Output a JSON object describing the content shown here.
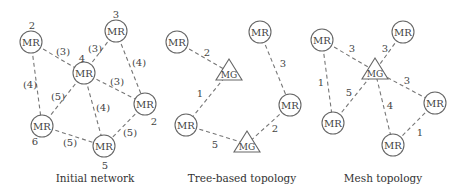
{
  "panels": [
    {
      "id": "initial",
      "caption": "Initial network",
      "caption_pos": [
        95,
        178
      ],
      "nodes": [
        {
          "id": "a",
          "type": "MR",
          "label": "MR",
          "x": 31,
          "y": 42,
          "tag": "2",
          "tag_pos": [
            32,
            25
          ]
        },
        {
          "id": "b",
          "type": "MR",
          "label": "MR",
          "x": 116,
          "y": 31,
          "tag": "3",
          "tag_pos": [
            116,
            14
          ]
        },
        {
          "id": "c",
          "type": "MR",
          "label": "MR",
          "x": 84,
          "y": 73,
          "tag": "4",
          "tag_pos": [
            82,
            58
          ]
        },
        {
          "id": "d",
          "type": "MR",
          "label": "MR",
          "x": 145,
          "y": 104,
          "tag": "2",
          "tag_pos": [
            154,
            121
          ]
        },
        {
          "id": "e",
          "type": "MR",
          "label": "MR",
          "x": 42,
          "y": 126,
          "tag": "6",
          "tag_pos": [
            35,
            141
          ]
        },
        {
          "id": "f",
          "type": "MR",
          "label": "MR",
          "x": 104,
          "y": 146,
          "tag": "5",
          "tag_pos": [
            105,
            165
          ]
        }
      ],
      "edges": [
        {
          "from": "a",
          "to": "c",
          "label": "(3)",
          "pos": [
            63,
            51
          ]
        },
        {
          "from": "b",
          "to": "c",
          "label": "(3)",
          "pos": [
            95,
            48
          ]
        },
        {
          "from": "b",
          "to": "d",
          "label": "(4)",
          "pos": [
            139,
            62
          ]
        },
        {
          "from": "c",
          "to": "d",
          "label": "(3)",
          "pos": [
            117,
            81
          ]
        },
        {
          "from": "a",
          "to": "e",
          "label": "(4)",
          "pos": [
            30,
            84
          ]
        },
        {
          "from": "c",
          "to": "e",
          "label": "(5)",
          "pos": [
            58,
            96
          ]
        },
        {
          "from": "c",
          "to": "f",
          "label": "(4)",
          "pos": [
            103,
            107
          ]
        },
        {
          "from": "e",
          "to": "f",
          "label": "(5)",
          "pos": [
            70,
            142
          ]
        },
        {
          "from": "d",
          "to": "f",
          "label": "(5)",
          "pos": [
            130,
            132
          ]
        }
      ]
    },
    {
      "id": "tree",
      "caption": "Tree-based topology",
      "caption_pos": [
        242,
        178
      ],
      "nodes": [
        {
          "id": "a",
          "type": "MR",
          "label": "MR",
          "x": 177,
          "y": 42
        },
        {
          "id": "g1",
          "type": "MG",
          "label": "MG",
          "x": 229,
          "y": 72
        },
        {
          "id": "b",
          "type": "MR",
          "label": "MR",
          "x": 260,
          "y": 32
        },
        {
          "id": "c",
          "type": "MR",
          "label": "MR",
          "x": 290,
          "y": 105
        },
        {
          "id": "d",
          "type": "MR",
          "label": "MR",
          "x": 186,
          "y": 125
        },
        {
          "id": "g2",
          "type": "MG",
          "label": "MG",
          "x": 247,
          "y": 144
        }
      ],
      "edges": [
        {
          "from": "a",
          "to": "g1",
          "label": "2",
          "pos": [
            207,
            52
          ]
        },
        {
          "from": "g1",
          "to": "d",
          "label": "1",
          "pos": [
            200,
            93
          ]
        },
        {
          "from": "b",
          "to": "c",
          "label": "3",
          "pos": [
            283,
            63
          ]
        },
        {
          "from": "c",
          "to": "g2",
          "label": "2",
          "pos": [
            275,
            128
          ]
        },
        {
          "from": "d",
          "to": "g2",
          "label": "5",
          "pos": [
            215,
            144
          ]
        }
      ]
    },
    {
      "id": "mesh",
      "caption": "Mesh topology",
      "caption_pos": [
        383,
        178
      ],
      "nodes": [
        {
          "id": "a",
          "type": "MR",
          "label": "MR",
          "x": 322,
          "y": 40
        },
        {
          "id": "b",
          "type": "MR",
          "label": "MR",
          "x": 403,
          "y": 32
        },
        {
          "id": "g",
          "type": "MG",
          "label": "MG",
          "x": 375,
          "y": 71
        },
        {
          "id": "c",
          "type": "MR",
          "label": "MR",
          "x": 435,
          "y": 103
        },
        {
          "id": "d",
          "type": "MR",
          "label": "MR",
          "x": 333,
          "y": 123
        },
        {
          "id": "e",
          "type": "MR",
          "label": "MR",
          "x": 393,
          "y": 145
        }
      ],
      "edges": [
        {
          "from": "a",
          "to": "g",
          "label": "3",
          "pos": [
            352,
            48
          ]
        },
        {
          "from": "b",
          "to": "g",
          "label": "3",
          "pos": [
            385,
            48
          ]
        },
        {
          "from": "a",
          "to": "d",
          "label": "1",
          "pos": [
            321,
            82
          ]
        },
        {
          "from": "g",
          "to": "d",
          "label": "5",
          "pos": [
            349,
            92
          ]
        },
        {
          "from": "g",
          "to": "c",
          "label": "3",
          "pos": [
            407,
            80
          ]
        },
        {
          "from": "g",
          "to": "e",
          "label": "4",
          "pos": [
            390,
            105
          ]
        },
        {
          "from": "c",
          "to": "e",
          "label": "1",
          "pos": [
            420,
            132
          ]
        }
      ]
    }
  ]
}
